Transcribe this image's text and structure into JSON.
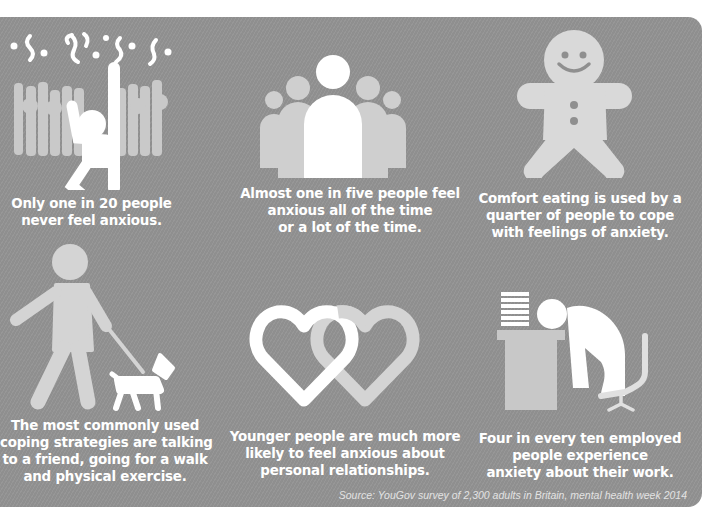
{
  "colors": {
    "background": "#8f8f8f",
    "primary_icon": "#ffffff",
    "secondary_icon": "#d2d2d2",
    "text": "#ffffff"
  },
  "facts": [
    {
      "icon": "celebrating-person-icon",
      "lines": [
        "Only one in 20 people",
        "never feel anxious."
      ]
    },
    {
      "icon": "group-of-people-icon",
      "lines": [
        "Almost one in five people feel",
        "anxious all of the time",
        "or a lot of the time."
      ]
    },
    {
      "icon": "gingerbread-man-icon",
      "lines": [
        "Comfort eating is used by a",
        "quarter of people to cope",
        "with feelings of anxiety."
      ]
    },
    {
      "icon": "person-walking-dog-icon",
      "lines": [
        "The most commonly used",
        "coping strategies are talking",
        "to a friend, going for a walk",
        "and physical exercise."
      ]
    },
    {
      "icon": "linked-hearts-icon",
      "lines": [
        "Younger people are much more",
        "likely to feel anxious about",
        "personal relationships."
      ]
    },
    {
      "icon": "stressed-worker-at-desk-icon",
      "lines": [
        "Four in every ten employed",
        "people experience",
        "anxiety about their work."
      ]
    }
  ],
  "source": "Source: YouGov survey of 2,300 adults in Britain, mental health week 2014"
}
